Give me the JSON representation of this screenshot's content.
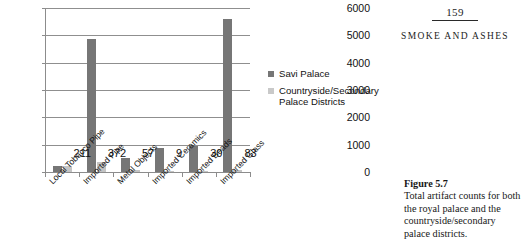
{
  "page": {
    "folio": "159",
    "running_title": "SMOKE AND ASHES"
  },
  "caption": {
    "label": "Figure 5.7",
    "text": "Total artifact counts for both the royal palace and the country­side/secondary palace districts."
  },
  "legend": {
    "items": [
      {
        "label": "Savi Palace",
        "color": "#767676",
        "key": "primary"
      },
      {
        "label": "Countryside/Secondary Palace Districts",
        "color": "#c9c9c9",
        "key": "secondary"
      }
    ]
  },
  "chart_data": {
    "type": "bar",
    "title": "",
    "xlabel": "",
    "ylabel": "",
    "ylim": [
      0,
      6000
    ],
    "ytick_labels": [
      "0",
      "1000",
      "2000",
      "3000",
      "4000",
      "5000",
      "6000"
    ],
    "ytick_values": [
      0,
      1000,
      2000,
      3000,
      4000,
      5000,
      6000
    ],
    "grid": true,
    "legend_position": "right",
    "categories": [
      "Local Tobacco Pipe",
      "Imported Pipe",
      "Metal Objects",
      "Imported Ceramics",
      "Imported Beads",
      "Imported Glass"
    ],
    "series": [
      {
        "name": "Savi Palace",
        "color": "#767676",
        "values": [
          230,
          4850,
          510,
          880,
          960,
          5600
        ]
      },
      {
        "name": "Countryside/Secondary Palace Districts",
        "color": "#c4c4c4",
        "values": [
          211,
          372,
          57,
          9,
          30,
          83
        ]
      }
    ],
    "data_labels": [
      "211",
      "372",
      "57",
      "9",
      "30",
      "83"
    ],
    "data_labels_series": "Countryside/Secondary Palace Districts"
  }
}
